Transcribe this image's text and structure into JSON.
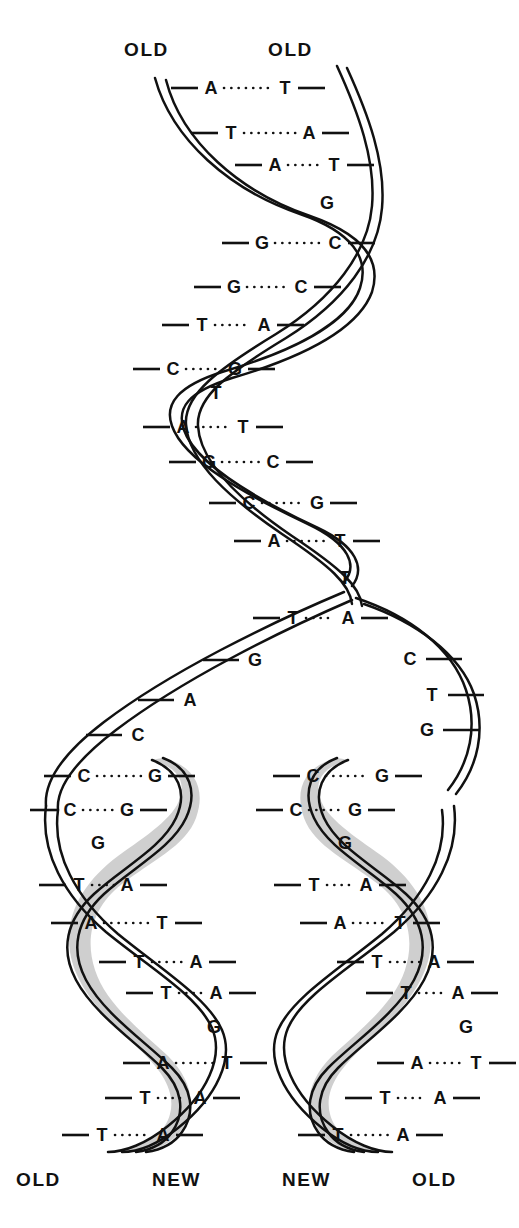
{
  "figure": {
    "type": "diagram",
    "ink_color": "#111111",
    "new_strand_shade_color": "#cfcfcf",
    "background_color": "#ffffff"
  },
  "labels": {
    "top_left": "OLD",
    "top_right": "OLD",
    "bottom_1": "OLD",
    "bottom_2": "NEW",
    "bottom_3": "NEW",
    "bottom_4": "OLD"
  },
  "parent_helix": {
    "name": "parent-duplex",
    "pairs": [
      {
        "left": "A",
        "right": "T",
        "y": 88,
        "lx": 211,
        "rx": 285,
        "paired": true
      },
      {
        "left": "T",
        "right": "A",
        "y": 133,
        "lx": 231,
        "rx": 309,
        "paired": true
      },
      {
        "left": "A",
        "right": "T",
        "y": 165,
        "lx": 275,
        "rx": 334,
        "paired": true
      },
      {
        "left": "",
        "right": "G",
        "y": 203,
        "lx": 0,
        "rx": 327,
        "paired": false
      },
      {
        "left": "G",
        "right": "C",
        "y": 243,
        "lx": 262,
        "rx": 335,
        "paired": true
      },
      {
        "left": "G",
        "right": "C",
        "y": 287,
        "lx": 234,
        "rx": 301,
        "paired": true
      },
      {
        "left": "T",
        "right": "A",
        "y": 325,
        "lx": 202,
        "rx": 264,
        "paired": true
      },
      {
        "left": "C",
        "right": "G",
        "y": 369,
        "lx": 173,
        "rx": 235,
        "paired": true
      },
      {
        "left": "T",
        "right": "",
        "y": 393,
        "lx": 216,
        "rx": 0,
        "paired": false
      },
      {
        "left": "A",
        "right": "T",
        "y": 427,
        "lx": 183,
        "rx": 243,
        "paired": true
      },
      {
        "left": "G",
        "right": "C",
        "y": 462,
        "lx": 209,
        "rx": 273,
        "paired": true
      },
      {
        "left": "C",
        "right": "G",
        "y": 503,
        "lx": 249,
        "rx": 317,
        "paired": true
      },
      {
        "left": "A",
        "right": "T",
        "y": 541,
        "lx": 274,
        "rx": 340,
        "paired": true
      },
      {
        "left": "T",
        "right": "",
        "y": 578,
        "lx": 345,
        "rx": 0,
        "paired": false
      }
    ]
  },
  "fork": {
    "name": "replication-fork",
    "paired": [
      {
        "left": "T",
        "right": "A",
        "y": 618,
        "lx": 293,
        "rx": 348
      }
    ],
    "left_template_unpaired": [
      {
        "base": "G",
        "y": 660,
        "x": 255
      },
      {
        "base": "A",
        "y": 700,
        "x": 190
      },
      {
        "base": "C",
        "y": 735,
        "x": 138
      }
    ],
    "right_template_unpaired": [
      {
        "base": "C",
        "y": 659,
        "x": 410
      },
      {
        "base": "T",
        "y": 695,
        "x": 432
      },
      {
        "base": "G",
        "y": 730,
        "x": 427
      }
    ]
  },
  "daughter_left": {
    "name": "daughter-duplex-left",
    "old_side": "left",
    "new_side": "right",
    "pairs": [
      {
        "left": "C",
        "right": "G",
        "y": 776,
        "lx": 84,
        "rx": 155,
        "paired": true
      },
      {
        "left": "C",
        "right": "G",
        "y": 810,
        "lx": 70,
        "rx": 127,
        "paired": true
      },
      {
        "left": "",
        "right": "G",
        "y": 843,
        "lx": 0,
        "rx": 98,
        "paired": false
      },
      {
        "left": "T",
        "right": "A",
        "y": 885,
        "lx": 79,
        "rx": 127,
        "paired": true
      },
      {
        "left": "A",
        "right": "T",
        "y": 923,
        "lx": 91,
        "rx": 162,
        "paired": true
      },
      {
        "left": "T",
        "right": "A",
        "y": 962,
        "lx": 139,
        "rx": 196,
        "paired": true
      },
      {
        "left": "T",
        "right": "A",
        "y": 993,
        "lx": 166,
        "rx": 216,
        "paired": true
      },
      {
        "left": "",
        "right": "G",
        "y": 1027,
        "lx": 0,
        "rx": 214,
        "paired": false
      },
      {
        "left": "A",
        "right": "T",
        "y": 1063,
        "lx": 163,
        "rx": 227,
        "paired": true
      },
      {
        "left": "T",
        "right": "A",
        "y": 1098,
        "lx": 145,
        "rx": 200,
        "paired": true
      },
      {
        "left": "T",
        "right": "A",
        "y": 1135,
        "lx": 102,
        "rx": 163,
        "paired": true
      }
    ]
  },
  "daughter_right": {
    "name": "daughter-duplex-right",
    "old_side": "right",
    "new_side": "left",
    "pairs": [
      {
        "left": "C",
        "right": "G",
        "y": 776,
        "lx": 313,
        "rx": 382,
        "paired": true
      },
      {
        "left": "C",
        "right": "G",
        "y": 810,
        "lx": 296,
        "rx": 355,
        "paired": true
      },
      {
        "left": "",
        "right": "G",
        "y": 843,
        "lx": 0,
        "rx": 345,
        "paired": false
      },
      {
        "left": "T",
        "right": "A",
        "y": 885,
        "lx": 314,
        "rx": 366,
        "paired": true
      },
      {
        "left": "A",
        "right": "T",
        "y": 923,
        "lx": 340,
        "rx": 400,
        "paired": true
      },
      {
        "left": "T",
        "right": "A",
        "y": 962,
        "lx": 377,
        "rx": 434,
        "paired": true
      },
      {
        "left": "T",
        "right": "A",
        "y": 993,
        "lx": 406,
        "rx": 458,
        "paired": true
      },
      {
        "left": "",
        "right": "G",
        "y": 1027,
        "lx": 0,
        "rx": 466,
        "paired": false
      },
      {
        "left": "A",
        "right": "T",
        "y": 1063,
        "lx": 417,
        "rx": 476,
        "paired": true
      },
      {
        "left": "T",
        "right": "A",
        "y": 1098,
        "lx": 385,
        "rx": 440,
        "paired": true
      },
      {
        "left": "T",
        "right": "A",
        "y": 1135,
        "lx": 338,
        "rx": 403,
        "paired": true
      }
    ]
  },
  "legend": {
    "old_meaning": "OLD",
    "new_meaning": "NEW"
  }
}
